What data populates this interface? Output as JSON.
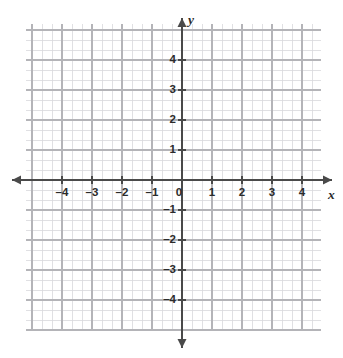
{
  "figure": {
    "kind": "coordinate-plane",
    "title": "",
    "background_color": "#ffffff"
  },
  "chart_data": {
    "type": "scatter",
    "title": "",
    "subtitle": "",
    "xlabel": "x",
    "ylabel": "y",
    "xlim": [
      -4.87,
      4.63
    ],
    "ylim": [
      -5.03,
      5.2
    ],
    "x_ticks": [
      -4,
      -3,
      -2,
      -1,
      0,
      1,
      2,
      3,
      4
    ],
    "y_ticks": [
      -4,
      -3,
      -2,
      -1,
      1,
      2,
      3,
      4
    ],
    "x_tick_labels": [
      "–4",
      "–3",
      "–2",
      "–1",
      "0",
      "1",
      "2",
      "3",
      "4"
    ],
    "y_tick_labels": [
      "–4",
      "–3",
      "–2",
      "–1",
      "1",
      "2",
      "3",
      "4"
    ],
    "origin_label": "0",
    "grid": true,
    "minor_grid": true,
    "minor_ticks_per_unit": 3,
    "legend": "none",
    "series": [],
    "values": [],
    "annotations": [],
    "axis_arrows": [
      "left",
      "right",
      "up",
      "down"
    ]
  },
  "style": {
    "axis_color": "#4a4a4a",
    "major_grid_color": "#b4b4b8",
    "minor_grid_color": "#d8d8dc",
    "label_color": "#2b2b2b",
    "plot_background": "#ffffff"
  },
  "geometry": {
    "grid_left": 26,
    "grid_right": 321,
    "grid_top": 24,
    "grid_bottom": 331,
    "origin_x": 182,
    "origin_y": 180,
    "unit_px": 30,
    "minor_px": 10
  },
  "axis_labels": {
    "x_axis_name": "x",
    "y_axis_name": "y"
  }
}
